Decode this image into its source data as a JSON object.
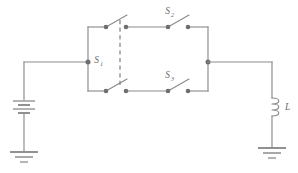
{
  "figure": {
    "background_color": "#ffffff",
    "line_color": "#8c8c8c",
    "node_color": "#6e6e6e",
    "label_color": "#6a6a6a"
  },
  "labels": {
    "s1": {
      "symbol": "S",
      "subscript": "1"
    },
    "s2": {
      "symbol": "S",
      "subscript": "2"
    },
    "s3": {
      "symbol": "S",
      "subscript": "3"
    },
    "load": {
      "symbol": "L",
      "subscript": ""
    }
  },
  "components": [
    {
      "id": "battery",
      "name": "battery",
      "label": "",
      "type": "multi-cell-battery",
      "position": "left-rail"
    },
    {
      "id": "ground-left",
      "name": "ground-left",
      "label": "",
      "type": "earth-ground",
      "position": "bottom-left"
    },
    {
      "id": "switch-s1-upper",
      "name": "switch-s1-upper-pole",
      "label": "S1",
      "type": "spst-open",
      "state": "open",
      "position": "upper-branch-left"
    },
    {
      "id": "switch-s1-lower",
      "name": "switch-s1-lower-pole",
      "label": "S1",
      "type": "spst-open",
      "state": "open",
      "position": "lower-branch-left"
    },
    {
      "id": "linkage-s1",
      "name": "s1-mechanical-linkage",
      "label": "",
      "type": "dashed-ganged-linkage",
      "position": "between-s1-poles"
    },
    {
      "id": "switch-s2",
      "name": "switch-s2",
      "label": "S2",
      "type": "spst-open",
      "state": "open",
      "position": "upper-branch-right"
    },
    {
      "id": "switch-s3",
      "name": "switch-s3",
      "label": "S3",
      "type": "spst-open",
      "state": "open",
      "position": "lower-branch-right"
    },
    {
      "id": "inductor",
      "name": "inductor-load",
      "label": "L",
      "type": "inductor-coil",
      "position": "right-rail"
    },
    {
      "id": "ground-right",
      "name": "ground-right",
      "label": "",
      "type": "earth-ground",
      "position": "bottom-right"
    }
  ],
  "nodes": [
    {
      "name": "node-left-rail",
      "x": 88,
      "y": 62
    },
    {
      "name": "node-right-rail",
      "x": 208,
      "y": 62
    },
    {
      "name": "node-upper-s1-left",
      "x": 106,
      "y": 27
    },
    {
      "name": "node-upper-s1-right",
      "x": 126,
      "y": 27
    },
    {
      "name": "node-upper-s2-left",
      "x": 168,
      "y": 27
    },
    {
      "name": "node-upper-s2-right",
      "x": 188,
      "y": 27
    },
    {
      "name": "node-lower-s1-left",
      "x": 106,
      "y": 91
    },
    {
      "name": "node-lower-s1-right",
      "x": 126,
      "y": 91
    },
    {
      "name": "node-lower-s3-left",
      "x": 168,
      "y": 91
    },
    {
      "name": "node-lower-s3-right",
      "x": 188,
      "y": 91
    }
  ]
}
